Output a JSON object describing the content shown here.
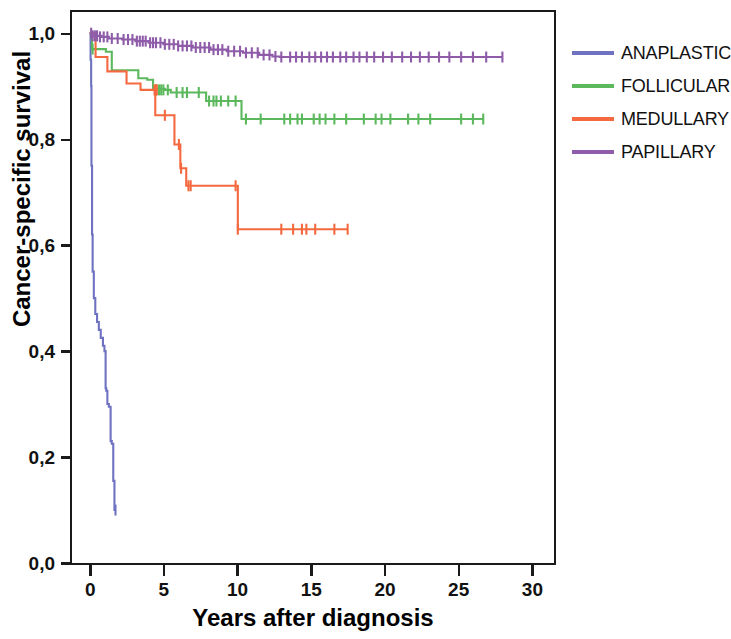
{
  "chart_data": {
    "type": "line",
    "subtype": "kaplan-meier-survival",
    "title": "",
    "xlabel": "Years after diagnosis",
    "ylabel": "Cancer-specific survival",
    "xlim": [
      -1.2,
      31.5
    ],
    "ylim": [
      0.0,
      1.04
    ],
    "xticks": [
      0,
      5,
      10,
      15,
      20,
      25,
      30
    ],
    "xtick_labels": [
      "0",
      "5",
      "10",
      "15",
      "20",
      "25",
      "30"
    ],
    "yticks": [
      0.0,
      0.2,
      0.4,
      0.6,
      0.8,
      1.0
    ],
    "ytick_labels": [
      "0,0",
      "0,2",
      "0,4",
      "0,6",
      "0,8",
      "1,0"
    ],
    "grid": false,
    "legend_position": "right",
    "decimal_separator": ",",
    "series": [
      {
        "name": "ANAPLASTIC",
        "color": "#6f72c0",
        "points": [
          [
            0.0,
            1.0
          ],
          [
            0.06,
            0.95
          ],
          [
            0.1,
            0.9
          ],
          [
            0.12,
            0.75
          ],
          [
            0.16,
            0.62
          ],
          [
            0.2,
            0.55
          ],
          [
            0.28,
            0.5
          ],
          [
            0.38,
            0.47
          ],
          [
            0.5,
            0.455
          ],
          [
            0.62,
            0.44
          ],
          [
            0.75,
            0.425
          ],
          [
            0.9,
            0.41
          ],
          [
            1.0,
            0.4
          ],
          [
            1.08,
            0.33
          ],
          [
            1.12,
            0.325
          ],
          [
            1.2,
            0.3
          ],
          [
            1.3,
            0.295
          ],
          [
            1.42,
            0.23
          ],
          [
            1.5,
            0.225
          ],
          [
            1.6,
            0.155
          ],
          [
            1.68,
            0.1
          ],
          [
            1.75,
            0.1
          ]
        ],
        "censor_marks": [
          [
            1.75,
            0.1
          ]
        ],
        "final_survival": 0.1,
        "max_followup_years": 1.75
      },
      {
        "name": "FOLLICULAR",
        "color": "#5cb85c",
        "points": [
          [
            0.0,
            1.0
          ],
          [
            0.15,
            0.97
          ],
          [
            1.1,
            0.965
          ],
          [
            1.5,
            0.93
          ],
          [
            3.0,
            0.93
          ],
          [
            3.3,
            0.915
          ],
          [
            3.9,
            0.912
          ],
          [
            4.3,
            0.895
          ],
          [
            5.1,
            0.893
          ],
          [
            5.5,
            0.888
          ],
          [
            7.6,
            0.888
          ],
          [
            7.9,
            0.872
          ],
          [
            10.0,
            0.872
          ],
          [
            10.3,
            0.838
          ],
          [
            26.7,
            0.838
          ]
        ],
        "censor_marks": [
          [
            0.2,
            0.97
          ],
          [
            4.5,
            0.893
          ],
          [
            4.7,
            0.893
          ],
          [
            4.85,
            0.893
          ],
          [
            5.0,
            0.893
          ],
          [
            5.3,
            0.893
          ],
          [
            5.9,
            0.888
          ],
          [
            6.3,
            0.888
          ],
          [
            6.6,
            0.888
          ],
          [
            7.4,
            0.888
          ],
          [
            8.1,
            0.872
          ],
          [
            8.4,
            0.872
          ],
          [
            8.6,
            0.872
          ],
          [
            8.9,
            0.872
          ],
          [
            9.4,
            0.872
          ],
          [
            9.9,
            0.872
          ],
          [
            10.6,
            0.838
          ],
          [
            11.6,
            0.838
          ],
          [
            13.2,
            0.838
          ],
          [
            13.6,
            0.838
          ],
          [
            14.1,
            0.838
          ],
          [
            14.4,
            0.838
          ],
          [
            15.2,
            0.838
          ],
          [
            15.6,
            0.838
          ],
          [
            16.0,
            0.838
          ],
          [
            16.6,
            0.838
          ],
          [
            17.4,
            0.838
          ],
          [
            18.6,
            0.838
          ],
          [
            19.4,
            0.838
          ],
          [
            19.8,
            0.838
          ],
          [
            20.4,
            0.838
          ],
          [
            21.6,
            0.838
          ],
          [
            22.3,
            0.838
          ],
          [
            23.1,
            0.838
          ],
          [
            25.2,
            0.838
          ],
          [
            26.0,
            0.838
          ],
          [
            26.7,
            0.838
          ]
        ],
        "final_survival": 0.838,
        "max_followup_years": 26.7
      },
      {
        "name": "MEDULLARY",
        "color": "#f4693f",
        "points": [
          [
            0.0,
            1.0
          ],
          [
            0.35,
            1.0
          ],
          [
            0.4,
            0.955
          ],
          [
            1.1,
            0.955
          ],
          [
            1.2,
            0.928
          ],
          [
            2.4,
            0.928
          ],
          [
            2.5,
            0.905
          ],
          [
            3.3,
            0.905
          ],
          [
            3.45,
            0.893
          ],
          [
            4.3,
            0.893
          ],
          [
            4.45,
            0.845
          ],
          [
            5.6,
            0.845
          ],
          [
            5.75,
            0.79
          ],
          [
            6.0,
            0.79
          ],
          [
            6.15,
            0.745
          ],
          [
            6.4,
            0.745
          ],
          [
            6.55,
            0.712
          ],
          [
            9.9,
            0.712
          ],
          [
            10.05,
            0.63
          ],
          [
            17.5,
            0.63
          ]
        ],
        "censor_marks": [
          [
            4.4,
            0.893
          ],
          [
            4.5,
            0.893
          ],
          [
            4.55,
            0.893
          ],
          [
            5.1,
            0.845
          ],
          [
            6.05,
            0.79
          ],
          [
            6.2,
            0.745
          ],
          [
            6.7,
            0.712
          ],
          [
            6.85,
            0.712
          ],
          [
            9.9,
            0.712
          ],
          [
            10.05,
            0.63
          ],
          [
            13.0,
            0.63
          ],
          [
            13.8,
            0.63
          ],
          [
            14.4,
            0.63
          ],
          [
            14.7,
            0.63
          ],
          [
            15.3,
            0.63
          ],
          [
            16.6,
            0.63
          ],
          [
            17.5,
            0.63
          ]
        ],
        "final_survival": 0.63,
        "max_followup_years": 17.5
      },
      {
        "name": "PAPILLARY",
        "color": "#8e5ca8",
        "points": [
          [
            0.0,
            1.0
          ],
          [
            0.18,
            0.995
          ],
          [
            0.8,
            0.993
          ],
          [
            1.3,
            0.99
          ],
          [
            2.2,
            0.988
          ],
          [
            3.1,
            0.985
          ],
          [
            4.0,
            0.982
          ],
          [
            5.0,
            0.979
          ],
          [
            6.0,
            0.976
          ],
          [
            7.0,
            0.973
          ],
          [
            8.2,
            0.969
          ],
          [
            9.3,
            0.966
          ],
          [
            10.4,
            0.963
          ],
          [
            11.5,
            0.959
          ],
          [
            12.4,
            0.956
          ],
          [
            12.9,
            0.955
          ],
          [
            28.0,
            0.955
          ]
        ],
        "censor_marks": [
          [
            0.1,
            1.0
          ],
          [
            0.2,
            0.995
          ],
          [
            0.35,
            0.995
          ],
          [
            0.5,
            0.995
          ],
          [
            0.7,
            0.993
          ],
          [
            0.95,
            0.993
          ],
          [
            1.2,
            0.993
          ],
          [
            1.5,
            0.99
          ],
          [
            1.9,
            0.99
          ],
          [
            2.3,
            0.988
          ],
          [
            2.6,
            0.988
          ],
          [
            2.9,
            0.988
          ],
          [
            3.2,
            0.985
          ],
          [
            3.4,
            0.985
          ],
          [
            3.6,
            0.985
          ],
          [
            3.8,
            0.985
          ],
          [
            4.1,
            0.982
          ],
          [
            4.3,
            0.982
          ],
          [
            4.5,
            0.982
          ],
          [
            4.8,
            0.982
          ],
          [
            5.1,
            0.979
          ],
          [
            5.4,
            0.979
          ],
          [
            5.7,
            0.979
          ],
          [
            6.0,
            0.976
          ],
          [
            6.3,
            0.976
          ],
          [
            6.6,
            0.976
          ],
          [
            6.9,
            0.976
          ],
          [
            7.2,
            0.973
          ],
          [
            7.5,
            0.973
          ],
          [
            7.8,
            0.973
          ],
          [
            8.1,
            0.973
          ],
          [
            8.4,
            0.969
          ],
          [
            8.7,
            0.969
          ],
          [
            9.0,
            0.969
          ],
          [
            9.4,
            0.966
          ],
          [
            9.8,
            0.966
          ],
          [
            10.2,
            0.966
          ],
          [
            10.6,
            0.963
          ],
          [
            11.0,
            0.963
          ],
          [
            11.4,
            0.963
          ],
          [
            11.8,
            0.959
          ],
          [
            12.2,
            0.959
          ],
          [
            12.6,
            0.956
          ],
          [
            13.0,
            0.955
          ],
          [
            13.6,
            0.955
          ],
          [
            14.0,
            0.955
          ],
          [
            14.4,
            0.955
          ],
          [
            14.9,
            0.955
          ],
          [
            15.3,
            0.955
          ],
          [
            15.7,
            0.955
          ],
          [
            16.1,
            0.955
          ],
          [
            16.5,
            0.955
          ],
          [
            17.0,
            0.955
          ],
          [
            17.4,
            0.955
          ],
          [
            17.9,
            0.955
          ],
          [
            18.3,
            0.955
          ],
          [
            18.8,
            0.955
          ],
          [
            19.3,
            0.955
          ],
          [
            19.9,
            0.955
          ],
          [
            20.5,
            0.955
          ],
          [
            21.2,
            0.955
          ],
          [
            21.8,
            0.955
          ],
          [
            22.4,
            0.955
          ],
          [
            23.0,
            0.955
          ],
          [
            23.7,
            0.955
          ],
          [
            24.4,
            0.955
          ],
          [
            25.2,
            0.955
          ],
          [
            26.0,
            0.955
          ],
          [
            26.9,
            0.955
          ],
          [
            28.0,
            0.955
          ]
        ],
        "final_survival": 0.955,
        "max_followup_years": 28.0
      }
    ]
  },
  "axes": {
    "y_title": "Cancer-specific survival",
    "x_title": "Years after diagnosis"
  },
  "legend": {
    "entries": [
      {
        "label": "ANAPLASTIC",
        "color": "#6f72c0"
      },
      {
        "label": "FOLLICULAR",
        "color": "#5cb85c"
      },
      {
        "label": "MEDULLARY",
        "color": "#f4693f"
      },
      {
        "label": "PAPILLARY",
        "color": "#8e5ca8"
      }
    ]
  }
}
